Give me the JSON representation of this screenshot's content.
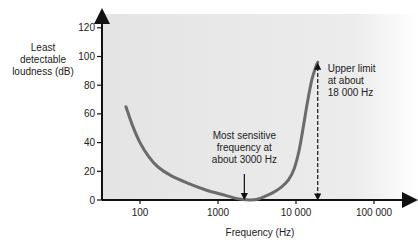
{
  "chart_data": {
    "type": "line",
    "title": "",
    "xlabel": "Frequency (Hz)",
    "ylabel_lines": [
      "Least",
      "detectable",
      "loudness (dB)"
    ],
    "xscale": "log",
    "xlim": [
      30,
      300000
    ],
    "ylim": [
      0,
      125
    ],
    "xticks": [
      {
        "value": 100,
        "label": "100"
      },
      {
        "value": 1000,
        "label": "1000"
      },
      {
        "value": 10000,
        "label": "10 000"
      },
      {
        "value": 100000,
        "label": "100 000"
      }
    ],
    "yticks": [
      {
        "value": 0,
        "label": "0"
      },
      {
        "value": 20,
        "label": "20"
      },
      {
        "value": 40,
        "label": "40"
      },
      {
        "value": 60,
        "label": "60"
      },
      {
        "value": 80,
        "label": "80"
      },
      {
        "value": 100,
        "label": "100"
      },
      {
        "value": 120,
        "label": "120"
      }
    ],
    "grid": false,
    "series": [
      {
        "name": "Hearing threshold",
        "color": "#6b6b6b",
        "points": [
          [
            66,
            65
          ],
          [
            80,
            52
          ],
          [
            100,
            40
          ],
          [
            130,
            30
          ],
          [
            170,
            23
          ],
          [
            250,
            17
          ],
          [
            400,
            12
          ],
          [
            700,
            7
          ],
          [
            1100,
            4
          ],
          [
            1600,
            1.5
          ],
          [
            2100,
            0.3
          ],
          [
            2600,
            0
          ],
          [
            3200,
            0.5
          ],
          [
            4000,
            2.5
          ],
          [
            5000,
            5
          ],
          [
            6500,
            9
          ],
          [
            8000,
            14
          ],
          [
            9500,
            22
          ],
          [
            11000,
            35
          ],
          [
            12500,
            52
          ],
          [
            14000,
            68
          ],
          [
            16000,
            84
          ],
          [
            18000,
            93
          ],
          [
            19000,
            96
          ]
        ]
      }
    ],
    "annotations": [
      {
        "id": "most-sensitive",
        "lines": [
          "Most sensitive",
          "frequency at",
          "about 3000 Hz"
        ],
        "arrow_x": 2600,
        "arrow_from_db": 18,
        "arrow_to_db": 1
      },
      {
        "id": "upper-limit",
        "lines": [
          "Upper limit",
          "at about",
          "18  000 Hz"
        ],
        "arrow_x": 19000,
        "arrow_from_db": 0,
        "arrow_to_db": 96,
        "dashed": true
      }
    ],
    "plot_background": "#e9e9e9"
  }
}
